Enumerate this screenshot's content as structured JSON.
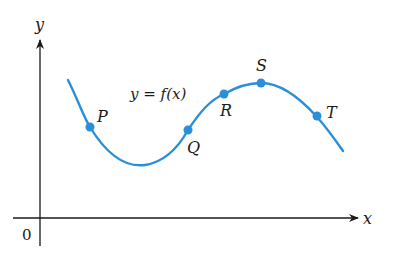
{
  "diagram": {
    "axes": {
      "x_label": "x",
      "y_label": "y",
      "origin_label": "0"
    },
    "curve": {
      "label": "y = f(x)",
      "color": "#2a8fd6"
    },
    "points": [
      {
        "name": "P",
        "label": "P"
      },
      {
        "name": "Q",
        "label": "Q"
      },
      {
        "name": "R",
        "label": "R"
      },
      {
        "name": "S",
        "label": "S"
      },
      {
        "name": "T",
        "label": "T"
      }
    ],
    "colors": {
      "axis": "#1a1a1a",
      "curve": "#2a8fd6",
      "point": "#2a8fd6"
    }
  }
}
